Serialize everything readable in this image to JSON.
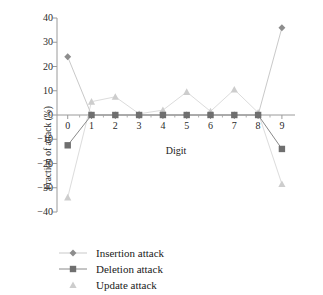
{
  "chart_data": {
    "type": "line",
    "title": "",
    "xlabel": "Digit",
    "ylabel": "Fraction of attack (%)",
    "categories": [
      "0",
      "1",
      "2",
      "3",
      "4",
      "5",
      "6",
      "7",
      "8",
      "9"
    ],
    "x": [
      0,
      1,
      2,
      3,
      4,
      5,
      6,
      7,
      8,
      9
    ],
    "xlim": [
      -0.45,
      9.55
    ],
    "ylim": [
      -40,
      40
    ],
    "yticks": [
      -40,
      -30,
      -20,
      -10,
      0,
      10,
      20,
      30,
      40
    ],
    "ytick_labels": [
      "−40",
      "−30",
      "−20",
      "−10",
      "0",
      "10",
      "20",
      "30",
      "40"
    ],
    "xticks": [
      0,
      1,
      2,
      3,
      4,
      5,
      6,
      7,
      8,
      9
    ],
    "xtick_labels": [
      "0",
      "1",
      "2",
      "3",
      "4",
      "5",
      "6",
      "7",
      "8",
      "9"
    ],
    "grid": false,
    "legend_position": "below-left",
    "series": [
      {
        "name": "Insertion attack",
        "marker": "diamond",
        "color": "#8d8d8d",
        "line_color": "#c9c9c9",
        "values": [
          24.0,
          0.0,
          0.0,
          0.0,
          0.0,
          0.0,
          0.0,
          0.0,
          0.0,
          36.0
        ]
      },
      {
        "name": "Deletion attack",
        "marker": "square",
        "color": "#6f6f6f",
        "line_color": "#8a8a8a",
        "values": [
          -12.5,
          0.0,
          0.0,
          0.0,
          0.0,
          0.0,
          0.0,
          0.0,
          0.0,
          -14.0
        ]
      },
      {
        "name": "Update attack",
        "marker": "triangle",
        "color": "#cdcdcd",
        "line_color": "#dcdcdc",
        "values": [
          -34.0,
          5.5,
          7.5,
          0.5,
          2.0,
          9.5,
          1.5,
          10.5,
          1.0,
          -28.5
        ]
      }
    ]
  },
  "legend": {
    "items": [
      {
        "label": "Insertion attack",
        "marker": "diamond-marker",
        "color": "#8d8d8d"
      },
      {
        "label": "Deletion attack",
        "marker": "square-marker",
        "color": "#6f6f6f"
      },
      {
        "label": "Update attack",
        "marker": "triangle-marker",
        "color": "#cdcdcd"
      }
    ]
  }
}
